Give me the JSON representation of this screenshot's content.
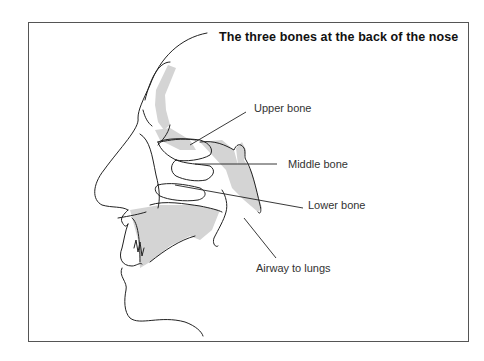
{
  "title": "The three bones at the back of the nose",
  "labels": {
    "upper_bone": "Upper bone",
    "middle_bone": "Middle bone",
    "lower_bone": "Lower bone",
    "airway": "Airway to lungs"
  },
  "colors": {
    "frame": "#555555",
    "line": "#222222",
    "shading": "#d4d4d4",
    "background": "#ffffff"
  }
}
